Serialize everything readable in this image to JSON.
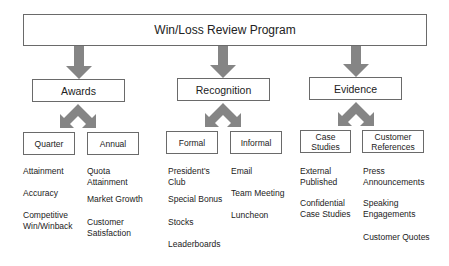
{
  "title": "Win/Loss Review Program",
  "colors": {
    "arrow": "#858585",
    "border": "#6a6a6a",
    "text": "#222222"
  },
  "categories": [
    {
      "label": "Awards",
      "children": [
        {
          "label": "Quarter",
          "items": [
            "Attainment",
            "Accuracy",
            "Competitive\nWin/Winback"
          ]
        },
        {
          "label": "Annual",
          "items": [
            "Quota\nAttainment",
            "Market Growth",
            "Customer\nSatisfaction"
          ]
        }
      ]
    },
    {
      "label": "Recognition",
      "children": [
        {
          "label": "Formal",
          "items": [
            "President's\nClub",
            "Special Bonus",
            "Stocks",
            "Leaderboards"
          ]
        },
        {
          "label": "Informal",
          "items": [
            "Email",
            "Team Meeting",
            "Luncheon"
          ]
        }
      ]
    },
    {
      "label": "Evidence",
      "children": [
        {
          "label": "Case\nStudies",
          "items": [
            "External\nPublished",
            "Confidential\nCase Studies"
          ]
        },
        {
          "label": "Customer\nReferences",
          "items": [
            "Press\nAnnouncements",
            "Speaking\nEngagements",
            "Customer Quotes"
          ]
        }
      ]
    }
  ]
}
